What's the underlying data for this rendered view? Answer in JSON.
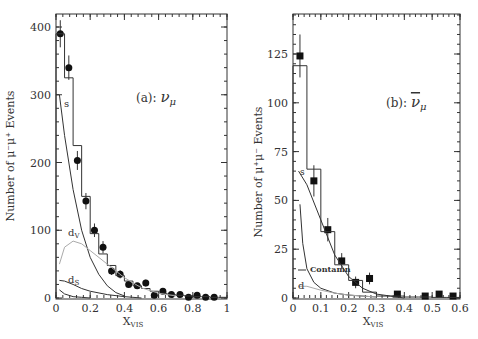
{
  "chart_data": [
    {
      "type": "bar",
      "panel_label": "(a): ν_μ",
      "xlabel": "X_VIS",
      "ylabel": "Number of μ⁻μ⁺ Events",
      "xlim": [
        0,
        1
      ],
      "ylim": [
        0,
        420
      ],
      "xticks": [
        "0",
        "0.2",
        "0.4",
        "0.6",
        "0.8",
        "1"
      ],
      "yticks": [
        "0",
        "100",
        "200",
        "300",
        "400"
      ],
      "series": [
        {
          "name": "Data",
          "style": "points-circle",
          "x": [
            0.025,
            0.075,
            0.125,
            0.175,
            0.225,
            0.275,
            0.325,
            0.375,
            0.425,
            0.475,
            0.525,
            0.575,
            0.625,
            0.675,
            0.725,
            0.775,
            0.825,
            0.875,
            0.925
          ],
          "y": [
            390,
            340,
            203,
            143,
            100,
            75,
            40,
            35,
            20,
            18,
            22,
            4,
            10,
            5,
            5,
            1,
            4,
            1,
            1
          ],
          "err": [
            20,
            18,
            14,
            12,
            10,
            9,
            6,
            6,
            5,
            4,
            5,
            2,
            3,
            2,
            2,
            1,
            2,
            1,
            1
          ]
        },
        {
          "name": "Total MC histogram",
          "style": "step",
          "bin_edges": [
            0,
            0.05,
            0.1,
            0.15,
            0.2,
            0.25,
            0.3,
            0.35,
            0.4,
            0.45,
            0.5,
            0.55,
            0.6,
            0.65,
            0.7,
            0.75,
            0.8,
            0.85,
            0.9,
            0.95,
            1.0
          ],
          "values": [
            390,
            325,
            225,
            150,
            95,
            65,
            48,
            33,
            25,
            18,
            14,
            10,
            7,
            5,
            4,
            3,
            2,
            2,
            1,
            1
          ]
        },
        {
          "name": "s",
          "style": "line",
          "x": [
            0.02,
            0.05,
            0.1,
            0.15,
            0.2,
            0.25,
            0.3,
            0.35,
            0.4
          ],
          "y": [
            300,
            240,
            160,
            100,
            60,
            35,
            18,
            8,
            3
          ]
        },
        {
          "name": "d_v",
          "style": "line-gray",
          "x": [
            0.02,
            0.05,
            0.1,
            0.15,
            0.2,
            0.3,
            0.4,
            0.5,
            0.6,
            0.7
          ],
          "y": [
            50,
            75,
            84,
            80,
            70,
            50,
            30,
            15,
            7,
            3
          ]
        },
        {
          "name": "d_s",
          "style": "line",
          "x": [
            0.02,
            0.05,
            0.1,
            0.15,
            0.2,
            0.3,
            0.4,
            0.5
          ],
          "y": [
            26,
            25,
            20,
            14,
            10,
            5,
            2,
            0
          ]
        },
        {
          "name": "small",
          "style": "line",
          "x": [
            0.02,
            0.05,
            0.1,
            0.15,
            0.2
          ],
          "y": [
            12,
            6,
            2,
            1,
            0
          ]
        }
      ],
      "annotations": [
        "s",
        "d_v",
        "d_s"
      ]
    },
    {
      "type": "bar",
      "panel_label": "(b): ν̄_μ",
      "xlabel": "X_VIS",
      "ylabel": "Number of μ⁺μ⁻ Events",
      "xlim": [
        0,
        0.6
      ],
      "ylim": [
        0,
        145
      ],
      "xticks": [
        "0",
        "0.1",
        "0.2",
        "0.3",
        "0.4",
        "0.5",
        "0.6"
      ],
      "yticks": [
        "0",
        "25",
        "50",
        "75",
        "100",
        "125"
      ],
      "series": [
        {
          "name": "Data",
          "style": "points-square",
          "x": [
            0.025,
            0.075,
            0.125,
            0.175,
            0.225,
            0.275,
            0.375,
            0.475,
            0.525,
            0.575
          ],
          "y": [
            124,
            60,
            35,
            19,
            8,
            10,
            2,
            1,
            2,
            1
          ],
          "err": [
            11,
            8,
            6,
            4,
            3,
            3,
            1.5,
            1,
            1.5,
            1
          ]
        },
        {
          "name": "Total MC histogram",
          "style": "step",
          "bin_edges": [
            0,
            0.05,
            0.1,
            0.15,
            0.2,
            0.25,
            0.3,
            0.35,
            0.4,
            0.45,
            0.5,
            0.55,
            0.6
          ],
          "values": [
            119,
            66,
            34,
            17,
            9,
            3,
            1,
            1,
            0.5,
            0.5,
            0.3,
            0.3
          ]
        },
        {
          "name": "s",
          "style": "line",
          "x": [
            0.02,
            0.05,
            0.1,
            0.15,
            0.2,
            0.25,
            0.3,
            0.35,
            0.4
          ],
          "y": [
            65,
            58,
            40,
            22,
            11,
            5,
            2,
            1,
            0
          ]
        },
        {
          "name": "Contamn",
          "style": "line",
          "x": [
            0.025,
            0.035,
            0.05,
            0.075,
            0.1,
            0.15,
            0.2,
            0.3
          ],
          "y": [
            48,
            28,
            15,
            8,
            5,
            2.5,
            1.5,
            0.5
          ]
        },
        {
          "name": "d",
          "style": "line-gray",
          "x": [
            0.02,
            0.05,
            0.1,
            0.15,
            0.2,
            0.3
          ],
          "y": [
            6,
            6,
            4,
            2.5,
            1.5,
            0.5
          ]
        }
      ],
      "annotations": [
        "s",
        "Contamn",
        "d"
      ]
    }
  ],
  "figure": {
    "left": {
      "label_a": "(a): ",
      "label_nu": "ν",
      "label_mu": "μ",
      "ylabel": "Number of  μ⁻μ⁺  Events",
      "xlabel_main": "X",
      "xlabel_sub": "VIS",
      "ann_s": "s",
      "ann_dv_main": "d",
      "ann_dv_sub": "V",
      "ann_ds_main": "d",
      "ann_ds_sub": "S"
    },
    "right": {
      "label_b": "(b): ",
      "label_nu": "ν",
      "label_mu": "μ",
      "ylabel": "Number of  μ⁺μ⁻  Events",
      "xlabel_main": "X",
      "xlabel_sub": "VIS",
      "ann_s": "s",
      "ann_contamn": "Contamn",
      "ann_d": "d"
    }
  }
}
